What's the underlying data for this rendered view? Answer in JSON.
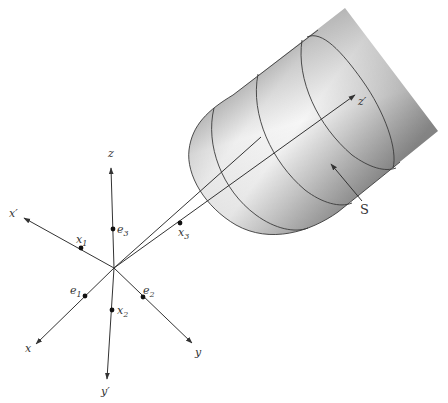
{
  "figure": {
    "type": "3d-coordinate-diagram",
    "origin": {
      "x": 114,
      "y": 268
    },
    "axes": [
      {
        "id": "z",
        "label": "z",
        "end": [
          111,
          168
        ],
        "label_pos": [
          108,
          157
        ]
      },
      {
        "id": "x_prime",
        "label": "x′",
        "end": [
          24,
          218
        ],
        "label_pos": [
          9,
          217
        ]
      },
      {
        "id": "x",
        "label": "x",
        "end": [
          36,
          344
        ],
        "label_pos": [
          25,
          351
        ]
      },
      {
        "id": "y",
        "label": "y",
        "end": [
          192,
          343
        ],
        "label_pos": [
          194,
          355
        ]
      },
      {
        "id": "y_prime",
        "label": "y′",
        "end": [
          107,
          379
        ],
        "label_pos": [
          101,
          394
        ]
      },
      {
        "id": "z_prime",
        "label": "z′",
        "end": [
          355,
          95
        ],
        "label_pos": [
          358,
          105
        ]
      }
    ],
    "points": [
      {
        "id": "x1",
        "label": "x",
        "sub": "1",
        "pos": [
          81,
          248
        ],
        "label_pos": [
          77,
          242
        ]
      },
      {
        "id": "e3",
        "label": "e",
        "sub": "3",
        "pos": [
          113,
          229
        ],
        "label_pos": [
          117,
          233
        ]
      },
      {
        "id": "x3",
        "label": "x",
        "sub": "3",
        "pos": [
          180,
          223
        ],
        "label_pos": [
          180,
          235
        ]
      },
      {
        "id": "e1",
        "label": "e",
        "sub": "1",
        "pos": [
          85,
          296
        ],
        "label_pos": [
          71,
          293
        ]
      },
      {
        "id": "e2",
        "label": "e",
        "sub": "2",
        "pos": [
          143,
          297
        ],
        "label_pos": [
          144,
          294
        ]
      },
      {
        "id": "x2",
        "label": "x",
        "sub": "2",
        "pos": [
          112,
          310
        ],
        "label_pos": [
          117,
          314
        ]
      }
    ],
    "ray": {
      "from": [
        114,
        268
      ],
      "to": [
        261,
        137
      ]
    },
    "surface": {
      "label": "S",
      "label_pos": [
        362,
        213
      ],
      "arrow_from": [
        362,
        200
      ],
      "arrow_to": [
        330,
        163
      ]
    }
  }
}
